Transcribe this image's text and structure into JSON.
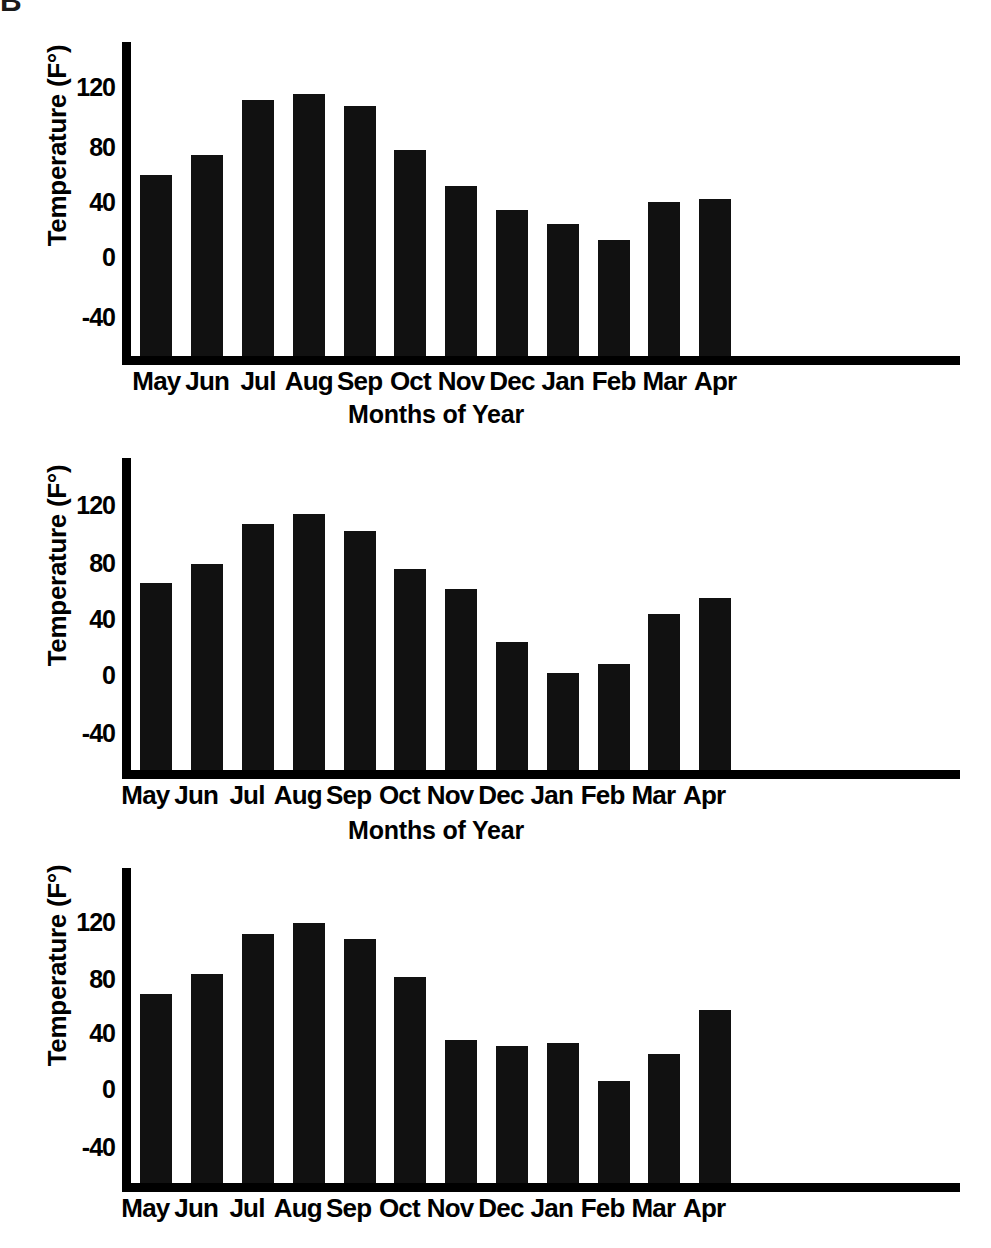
{
  "page": {
    "corner_artifact": "B",
    "background_color": "#ffffff",
    "bar_color": "#111111",
    "axis_color": "#000000"
  },
  "charts": [
    {
      "id": "chart-top",
      "ylabel": "Temperature (F°)",
      "xlabel": "Months of Year",
      "yticks": [
        "120",
        "80",
        "40",
        "0",
        "-40"
      ],
      "xticks": [
        "May",
        "Jun",
        "Jul",
        "Aug",
        "Sep",
        "Oct",
        "Nov",
        "Dec",
        "Jan",
        "Feb",
        "Mar",
        "Apr"
      ]
    },
    {
      "id": "chart-middle",
      "ylabel": "Temperature (F°)",
      "xlabel": "Months of Year",
      "yticks": [
        "120",
        "80",
        "40",
        "0",
        "-40"
      ],
      "xticks": [
        "May",
        "Jun",
        "Jul",
        "Aug",
        "Sep",
        "Oct",
        "Nov",
        "Dec",
        "Jan",
        "Feb",
        "Mar",
        "Apr"
      ]
    },
    {
      "id": "chart-bottom",
      "ylabel": "Temperature (F°)",
      "xlabel": "",
      "yticks": [
        "120",
        "80",
        "40",
        "0",
        "-40"
      ],
      "xticks": [
        "May",
        "Jun",
        "Jul",
        "Aug",
        "Sep",
        "Oct",
        "Nov",
        "Dec",
        "Jan",
        "Feb",
        "Mar",
        "Apr"
      ]
    }
  ],
  "chart_data": [
    {
      "type": "bar",
      "title": "",
      "xlabel": "Months of Year",
      "ylabel": "Temperature (F°)",
      "categories": [
        "May",
        "Jun",
        "Jul",
        "Aug",
        "Sep",
        "Oct",
        "Nov",
        "Dec",
        "Jan",
        "Feb",
        "Mar",
        "Apr"
      ],
      "values": [
        55,
        68,
        103,
        107,
        99,
        71,
        48,
        33,
        24,
        14,
        38,
        40
      ],
      "ylim": [
        -60,
        140
      ],
      "yticks": [
        -40,
        0,
        40,
        80,
        120
      ],
      "grid": false,
      "legend": "none"
    },
    {
      "type": "bar",
      "title": "",
      "xlabel": "Months of Year",
      "ylabel": "Temperature (F°)",
      "categories": [
        "May",
        "Jun",
        "Jul",
        "Aug",
        "Sep",
        "Oct",
        "Nov",
        "Dec",
        "Jan",
        "Feb",
        "Mar",
        "Apr"
      ],
      "values": [
        60,
        72,
        98,
        104,
        93,
        69,
        56,
        22,
        2,
        8,
        40,
        50
      ],
      "ylim": [
        -60,
        140
      ],
      "yticks": [
        -40,
        0,
        40,
        80,
        120
      ],
      "grid": false,
      "legend": "none"
    },
    {
      "type": "bar",
      "title": "",
      "xlabel": "",
      "ylabel": "Temperature (F°)",
      "categories": [
        "May",
        "Jun",
        "Jul",
        "Aug",
        "Sep",
        "Oct",
        "Nov",
        "Dec",
        "Jan",
        "Feb",
        "Mar",
        "Apr"
      ],
      "values": [
        60,
        73,
        98,
        105,
        95,
        71,
        31,
        27,
        29,
        5,
        22,
        50
      ],
      "ylim": [
        -60,
        140
      ],
      "yticks": [
        -40,
        0,
        40,
        80,
        120
      ],
      "grid": false,
      "legend": "none"
    }
  ]
}
